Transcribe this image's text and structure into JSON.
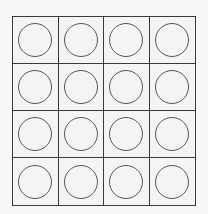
{
  "diagram": {
    "type": "grid-of-circles",
    "rows": 4,
    "columns": 4,
    "cells": [
      [
        "circle",
        "circle",
        "circle",
        "circle"
      ],
      [
        "circle",
        "circle",
        "circle",
        "circle"
      ],
      [
        "circle",
        "circle",
        "circle",
        "circle"
      ],
      [
        "circle",
        "circle",
        "circle",
        "circle"
      ]
    ],
    "colors": {
      "background": "#f7f7f7",
      "cell_fill": "#f4f4f4",
      "grid_line": "#3a3a3a",
      "circle_stroke": "#555555"
    }
  }
}
